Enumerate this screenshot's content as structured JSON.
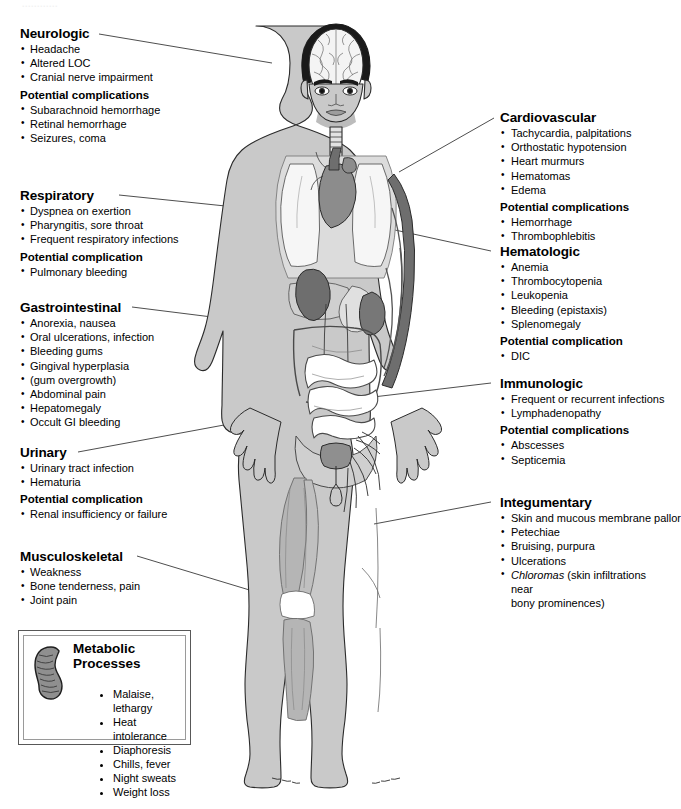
{
  "header": {
    "faint_cropped_title": "............"
  },
  "diagram": {
    "name": "body-systems-complications-diagram",
    "figure_alt": "anterior view of a human body showing brain, lungs, heart, kidney, liver, intestines, bladder, lymphatic vessels and arm vasculature",
    "colors": {
      "skin": "#c9c9c9",
      "skin_light": "#dcdcdc",
      "organ_dark": "#6e6e6e",
      "organ_mid": "#9a9a9a",
      "organ_light": "#e6e6e6",
      "outline": "#2b2b2b",
      "leader_line": "#3a3a3a",
      "box_border": "#585858",
      "text": "#000000"
    }
  },
  "left_column": [
    {
      "id": "neurologic",
      "title": "Neurologic",
      "items": [
        "Headache",
        "Altered LOC",
        "Cranial nerve impairment"
      ],
      "subtitle": "Potential complications",
      "sub_items": [
        "Subarachnoid hemorrhage",
        "Retinal hemorrhage",
        "Seizures, coma"
      ]
    },
    {
      "id": "respiratory",
      "title": "Respiratory",
      "items": [
        "Dyspnea on exertion",
        "Pharyngitis, sore throat",
        "Frequent respiratory infections"
      ],
      "subtitle": "Potential complication",
      "sub_items": [
        "Pulmonary bleeding"
      ]
    },
    {
      "id": "gastrointestinal",
      "title": "Gastrointestinal",
      "items": [
        "Anorexia, nausea",
        "Oral ulcerations, infection",
        "Bleeding gums",
        "Gingival hyperplasia",
        "(gum overgrowth)",
        "Abdominal pain",
        "Hepatomegaly",
        "Occult GI bleeding"
      ],
      "subtitle": "",
      "sub_items": []
    },
    {
      "id": "urinary",
      "title": "Urinary",
      "items": [
        "Urinary tract infection",
        "Hematuria"
      ],
      "subtitle": "Potential complication",
      "sub_items": [
        "Renal insufficiency or failure"
      ]
    },
    {
      "id": "musculoskeletal",
      "title": "Musculoskeletal",
      "items": [
        "Weakness",
        "Bone tenderness, pain",
        "Joint pain"
      ],
      "subtitle": "",
      "sub_items": []
    }
  ],
  "right_column": [
    {
      "id": "cardiovascular",
      "title": "Cardiovascular",
      "items": [
        "Tachycardia, palpitations",
        "Orthostatic hypotension",
        "Heart murmurs",
        "Hematomas",
        "Edema"
      ],
      "subtitle": "Potential complications",
      "sub_items": [
        "Hemorrhage",
        "Thrombophlebitis"
      ]
    },
    {
      "id": "hematologic",
      "title": "Hematologic",
      "items": [
        "Anemia",
        "Thrombocytopenia",
        "Leukopenia",
        "Bleeding (epistaxis)",
        "Splenomegaly"
      ],
      "subtitle": "Potential complication",
      "sub_items": [
        "DIC"
      ]
    },
    {
      "id": "immunologic",
      "title": "Immunologic",
      "items": [
        "Frequent or recurrent infections",
        "Lymphadenopathy"
      ],
      "subtitle": "Potential complications",
      "sub_items": [
        "Abscesses",
        "Septicemia"
      ]
    },
    {
      "id": "integumentary",
      "title": "Integumentary",
      "items": [
        "Skin and mucous membrane pallor",
        "Petechiae",
        "Bruising, purpura",
        "Ulcerations"
      ],
      "italic_item": {
        "ital": "Chloromas",
        "rest": " (skin infiltrations near",
        "cont": "bony prominences)"
      },
      "subtitle": "",
      "sub_items": []
    }
  ],
  "metabolic": {
    "title": "Metabolic Processes",
    "icon": "mitochondrion-icon",
    "items": [
      "Malaise, lethargy",
      "Heat intolerance",
      "Diaphoresis",
      "Chills, fever",
      "Night sweats",
      "Weight loss"
    ]
  }
}
